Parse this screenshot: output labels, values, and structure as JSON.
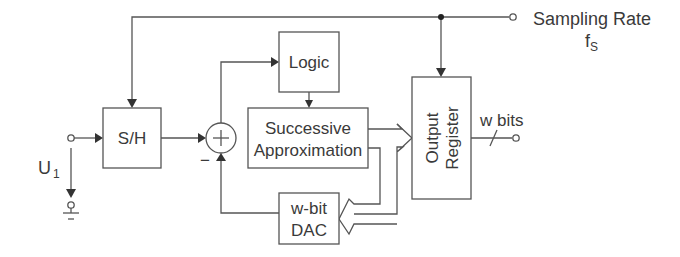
{
  "diagram": {
    "blocks": {
      "sample_hold": {
        "label": "S/H"
      },
      "logic": {
        "label": "Logic"
      },
      "successive_approximation": {
        "line1": "Successive",
        "line2": "Approximation"
      },
      "dac": {
        "line1": "w-bit",
        "line2": "DAC"
      },
      "output_register": {
        "line1": "Output",
        "line2": "Register"
      }
    },
    "summing_junction": {
      "symbol": "+",
      "negative_sign": "−"
    },
    "labels": {
      "input_voltage": "U",
      "input_voltage_sub": "1",
      "sampling_rate": "Sampling Rate",
      "sampling_freq": "f",
      "sampling_freq_sub": "S",
      "output_bits": "w bits"
    },
    "colors": {
      "line": "#555555",
      "text": "#3a3a3a",
      "background": "#ffffff"
    }
  }
}
